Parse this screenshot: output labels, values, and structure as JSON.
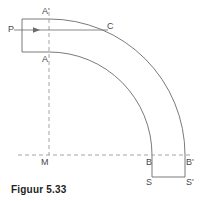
{
  "figure": {
    "caption": "Figuur 5.33",
    "type": "geometric-diagram",
    "stroke_color": "#6b6b6b",
    "dash_color": "#9a9a9a",
    "label_color": "#4a4a4a",
    "caption_color": "#231f20",
    "background": "#ffffff"
  },
  "labels": {
    "p": "P",
    "a_prime": "A'",
    "a": "A",
    "c": "C",
    "m": "M",
    "b": "B",
    "b_prime": "B'",
    "s": "S",
    "s_prime": "S'"
  },
  "geometry": {
    "center_m": {
      "x": 49,
      "y": 155
    },
    "inner_radius": 103,
    "outer_radius": 136,
    "arc_start_angle_deg": 90,
    "arc_end_angle_deg": 0,
    "band_width": 33,
    "straight_segment": {
      "left_x": 22,
      "right_x": 49,
      "top_y": 19,
      "bottom_y": 52
    },
    "bottom_segment": {
      "top_y": 155,
      "bottom_y": 177,
      "left_x": 152,
      "right_x": 185
    },
    "axis_line": {
      "from_x": 14,
      "to_x": 108,
      "y": 30
    },
    "arrow_head_x": 38,
    "dashed_vertical_x": 49,
    "dashed_horizontal_y": 155
  }
}
